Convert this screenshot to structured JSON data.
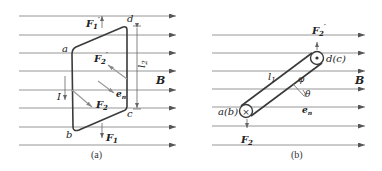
{
  "figure_a": {
    "caption": "(a)",
    "field_label": "B",
    "corners": {
      "a": "a",
      "b": "b",
      "c": "c",
      "d": "d"
    },
    "current_label": "I",
    "length_label": "l",
    "length_sub": "2",
    "forces": {
      "F1": {
        "main": "F",
        "sub": "1",
        "prime": ""
      },
      "F1p": {
        "main": "F",
        "sub": "1",
        "prime": "′"
      },
      "F2": {
        "main": "F",
        "sub": "2",
        "prime": ""
      },
      "F2p": {
        "main": "F",
        "sub": "2",
        "prime": "′"
      }
    },
    "normal_label": {
      "main": "e",
      "sub": "n"
    }
  },
  "figure_b": {
    "caption": "(b)",
    "field_label": "B",
    "end_ab": "a(b)",
    "end_dc": "d(c)",
    "length_label": "l",
    "length_sub": "1",
    "phi": "φ",
    "theta": "θ",
    "forces": {
      "F2": {
        "main": "F",
        "sub": "2",
        "prime": ""
      },
      "F2p": {
        "main": "F",
        "sub": "2",
        "prime": "′"
      }
    },
    "normal_label": {
      "main": "e",
      "sub": "n"
    },
    "current_in_symbol": "×",
    "current_out_symbol": "•"
  },
  "colors": {
    "field_line": "#8a8a8a",
    "loop": "#3a3a3a",
    "text": "#222222"
  }
}
